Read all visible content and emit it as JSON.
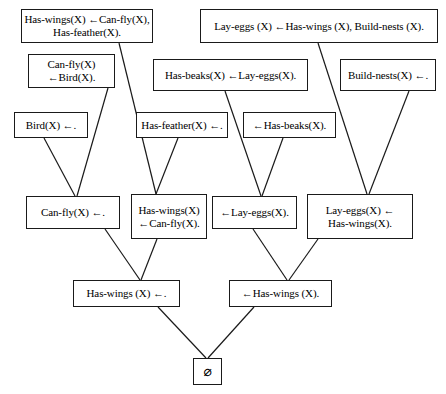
{
  "diagram": {
    "background_color": "#ffffff",
    "box_border_color": "#1a1a1a",
    "edge_color": "#1a1a1a",
    "width": 446,
    "height": 394
  },
  "nodes": [
    {
      "id": "has-wings-rule",
      "name": "clause-has-wings-rule",
      "lines": [
        "Has-wings(X) ←Can-fly(X),",
        "Has-feather(X)."
      ],
      "x": 21,
      "y": 9,
      "w": 132,
      "h": 34,
      "align": "center"
    },
    {
      "id": "lay-eggs-rule",
      "name": "clause-lay-eggs-rule",
      "lines": [
        "Lay-eggs (X) ←Has-wings (X), Build-nests (X)."
      ],
      "x": 200,
      "y": 9,
      "w": 238,
      "h": 34,
      "align": "center"
    },
    {
      "id": "can-fly-rule",
      "name": "clause-can-fly-rule",
      "lines": [
        "Can-fly(X)",
        "←Bird(X)."
      ],
      "x": 28,
      "y": 54,
      "w": 87,
      "h": 34,
      "align": "center"
    },
    {
      "id": "has-beaks-rule",
      "name": "clause-has-beaks-rule",
      "lines": [
        "Has-beaks(X) ←Lay-eggs(X)."
      ],
      "x": 153,
      "y": 59,
      "w": 155,
      "h": 32,
      "align": "center"
    },
    {
      "id": "build-nests-fact",
      "name": "clause-build-nests-fact",
      "lines": [
        "Build-nests(X) ←."
      ],
      "x": 340,
      "y": 59,
      "w": 96,
      "h": 32,
      "align": "center"
    },
    {
      "id": "bird-fact",
      "name": "clause-bird-fact",
      "lines": [
        "Bird(X) ←."
      ],
      "x": 14,
      "y": 112,
      "w": 74,
      "h": 26,
      "align": "center"
    },
    {
      "id": "has-feather-fact",
      "name": "clause-has-feather-fact",
      "lines": [
        "Has-feather(X) ←."
      ],
      "x": 136,
      "y": 112,
      "w": 92,
      "h": 26,
      "align": "center"
    },
    {
      "id": "goal-has-beaks",
      "name": "goal-has-beaks",
      "lines": [
        "←Has-beaks(X)."
      ],
      "x": 243,
      "y": 112,
      "w": 93,
      "h": 26,
      "align": "center"
    },
    {
      "id": "can-fly-fact",
      "name": "derived-can-fly-fact",
      "lines": [
        "Can-fly(X) ←."
      ],
      "x": 26,
      "y": 196,
      "w": 94,
      "h": 33,
      "align": "center"
    },
    {
      "id": "has-wings-can-fly",
      "name": "derived-has-wings-from-can-fly",
      "lines": [
        "Has-wings(X)",
        "←Can-fly(X)."
      ],
      "x": 131,
      "y": 194,
      "w": 76,
      "h": 45,
      "align": "center"
    },
    {
      "id": "goal-lay-eggs",
      "name": "goal-lay-eggs",
      "lines": [
        "←Lay-eggs(X)."
      ],
      "x": 212,
      "y": 196,
      "w": 85,
      "h": 33,
      "align": "center"
    },
    {
      "id": "lay-eggs-has-wings",
      "name": "derived-lay-eggs-from-has-wings",
      "lines": [
        "Lay-eggs(X) ←",
        "Has-wings(X)."
      ],
      "x": 307,
      "y": 194,
      "w": 106,
      "h": 45,
      "align": "center"
    },
    {
      "id": "has-wings-fact",
      "name": "derived-has-wings-fact",
      "lines": [
        "Has-wings (X) ←."
      ],
      "x": 73,
      "y": 280,
      "w": 107,
      "h": 27,
      "align": "center"
    },
    {
      "id": "goal-has-wings",
      "name": "goal-has-wings",
      "lines": [
        "←Has-wings (X)."
      ],
      "x": 229,
      "y": 280,
      "w": 103,
      "h": 27,
      "align": "center"
    },
    {
      "id": "empty-clause",
      "name": "empty-clause",
      "lines": [
        "⌀"
      ],
      "x": 193,
      "y": 358,
      "w": 29,
      "h": 27,
      "align": "center"
    }
  ],
  "edges": [
    {
      "name": "edge-has-wings-rule-to-has-wings-can-fly",
      "from": "has-wings-rule",
      "to": "has-wings-can-fly",
      "x1": 119,
      "y1": 43,
      "x2": 156,
      "y2": 194
    },
    {
      "name": "edge-can-fly-rule-to-can-fly-fact",
      "from": "can-fly-rule",
      "to": "can-fly-fact",
      "x1": 108,
      "y1": 88,
      "x2": 77,
      "y2": 196
    },
    {
      "name": "edge-bird-fact-to-can-fly-fact",
      "from": "bird-fact",
      "to": "can-fly-fact",
      "x1": 44,
      "y1": 138,
      "x2": 75,
      "y2": 196
    },
    {
      "name": "edge-has-feather-fact-to-has-wings-can-fly",
      "from": "has-feather-fact",
      "to": "has-wings-can-fly",
      "x1": 178,
      "y1": 138,
      "x2": 156,
      "y2": 194
    },
    {
      "name": "edge-has-beaks-rule-to-goal-lay-eggs",
      "from": "has-beaks-rule",
      "to": "goal-lay-eggs",
      "x1": 225,
      "y1": 91,
      "x2": 261,
      "y2": 196
    },
    {
      "name": "edge-goal-has-beaks-to-goal-lay-eggs",
      "from": "goal-has-beaks",
      "to": "goal-lay-eggs",
      "x1": 283,
      "y1": 138,
      "x2": 262,
      "y2": 196
    },
    {
      "name": "edge-lay-eggs-rule-to-lay-eggs-has-wings",
      "from": "lay-eggs-rule",
      "to": "lay-eggs-has-wings",
      "x1": 318,
      "y1": 43,
      "x2": 367,
      "y2": 194
    },
    {
      "name": "edge-build-nests-fact-to-lay-eggs-has-wings",
      "from": "build-nests-fact",
      "to": "lay-eggs-has-wings",
      "x1": 409,
      "y1": 91,
      "x2": 369,
      "y2": 194
    },
    {
      "name": "edge-can-fly-fact-to-has-wings-fact",
      "from": "can-fly-fact",
      "to": "has-wings-fact",
      "x1": 105,
      "y1": 229,
      "x2": 140,
      "y2": 280
    },
    {
      "name": "edge-has-wings-can-fly-to-has-wings-fact",
      "from": "has-wings-can-fly",
      "to": "has-wings-fact",
      "x1": 157,
      "y1": 239,
      "x2": 141,
      "y2": 280
    },
    {
      "name": "edge-goal-lay-eggs-to-goal-has-wings",
      "from": "goal-lay-eggs",
      "to": "goal-has-wings",
      "x1": 253,
      "y1": 229,
      "x2": 287,
      "y2": 280
    },
    {
      "name": "edge-lay-eggs-has-wings-to-goal-has-wings",
      "from": "lay-eggs-has-wings",
      "to": "goal-has-wings",
      "x1": 318,
      "y1": 239,
      "x2": 289,
      "y2": 280
    },
    {
      "name": "edge-has-wings-fact-to-empty-clause",
      "from": "has-wings-fact",
      "to": "empty-clause",
      "x1": 158,
      "y1": 307,
      "x2": 206,
      "y2": 358
    },
    {
      "name": "edge-goal-has-wings-to-empty-clause",
      "from": "goal-has-wings",
      "to": "empty-clause",
      "x1": 254,
      "y1": 307,
      "x2": 208,
      "y2": 358
    }
  ]
}
